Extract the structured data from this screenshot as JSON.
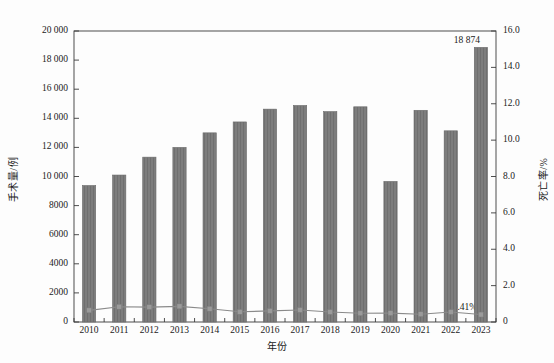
{
  "chart_data": {
    "type": "bar",
    "title": "",
    "xlabel": "年份",
    "categories": [
      "2010",
      "2011",
      "2012",
      "2013",
      "2014",
      "2015",
      "2016",
      "2017",
      "2018",
      "2019",
      "2020",
      "2021",
      "2022",
      "2023"
    ],
    "grid": false,
    "legend": "none",
    "axes": {
      "left": {
        "label": "手术量/例",
        "ylim": [
          0,
          20000
        ],
        "ticks": [
          0,
          2000,
          4000,
          6000,
          8000,
          10000,
          12000,
          14000,
          16000,
          18000,
          20000
        ],
        "tick_labels": [
          "0",
          "2000",
          "4000",
          "6000",
          "8000",
          "10 000",
          "12 000",
          "14 000",
          "16 000",
          "18 000",
          "20 000"
        ]
      },
      "right": {
        "label": "死亡率/%",
        "ylim": [
          0,
          16.0
        ],
        "ticks": [
          0,
          2.0,
          4.0,
          6.0,
          8.0,
          10.0,
          12.0,
          14.0,
          16.0
        ],
        "tick_labels": [
          "0",
          "2.0",
          "4.0",
          "6.0",
          "8.0",
          "10.0",
          "12.0",
          "14.0",
          "16.0"
        ]
      }
    },
    "series": [
      {
        "name": "手术量",
        "type": "bar",
        "axis": "left",
        "color": "#7d7d7d",
        "values": [
          9380,
          10100,
          11330,
          12000,
          13000,
          13750,
          14630,
          14880,
          14460,
          14790,
          9660,
          14550,
          13140,
          18874
        ]
      },
      {
        "name": "死亡率",
        "type": "line",
        "axis": "right",
        "color": "#8a8a8a",
        "values": [
          0.64,
          0.84,
          0.82,
          0.86,
          0.73,
          0.56,
          0.61,
          0.66,
          0.55,
          0.48,
          0.49,
          0.43,
          0.55,
          0.41
        ]
      }
    ],
    "annotations": [
      {
        "name": "bar-value-2023",
        "text": "18 874",
        "category": "2023",
        "value": 18874,
        "axis": "left"
      },
      {
        "name": "line-value-2023",
        "text": "0.41%",
        "category": "2023",
        "value": 0.41,
        "axis": "right"
      }
    ]
  }
}
